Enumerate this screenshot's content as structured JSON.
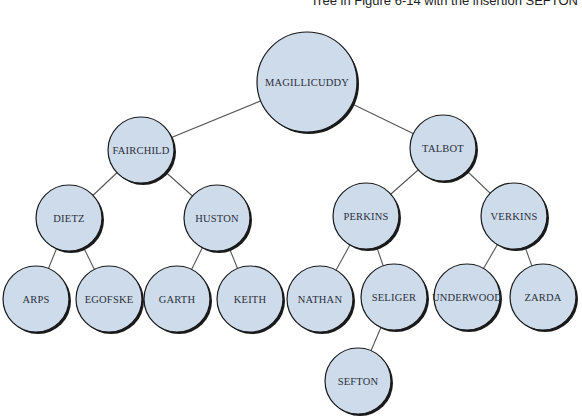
{
  "caption": "Tree in Figure 6-14 with the insertion SEFTON",
  "colors": {
    "node_fill": "#cddbeb",
    "node_stroke": "#1a1a1a",
    "edge": "#555555",
    "label": "#2b2f3a"
  },
  "nodes": [
    {
      "id": "magillicuddy",
      "label": "MAGILLICUDDY",
      "cx": 307,
      "cy": 82,
      "r": 50
    },
    {
      "id": "fairchild",
      "label": "FAIRCHILD",
      "cx": 141,
      "cy": 150,
      "r": 33
    },
    {
      "id": "talbot",
      "label": "TALBOT",
      "cx": 443,
      "cy": 148,
      "r": 33
    },
    {
      "id": "dietz",
      "label": "DIETZ",
      "cx": 69,
      "cy": 218,
      "r": 33
    },
    {
      "id": "huston",
      "label": "HUSTON",
      "cx": 217,
      "cy": 218,
      "r": 33
    },
    {
      "id": "perkins",
      "label": "PERKINS",
      "cx": 366,
      "cy": 216,
      "r": 33
    },
    {
      "id": "verkins",
      "label": "VERKINS",
      "cx": 514,
      "cy": 216,
      "r": 33
    },
    {
      "id": "arps",
      "label": "ARPS",
      "cx": 36,
      "cy": 299,
      "r": 33
    },
    {
      "id": "egofske",
      "label": "EGOFSKE",
      "cx": 109,
      "cy": 299,
      "r": 33
    },
    {
      "id": "garth",
      "label": "GARTH",
      "cx": 177,
      "cy": 299,
      "r": 33
    },
    {
      "id": "keith",
      "label": "KEITH",
      "cx": 250,
      "cy": 299,
      "r": 33
    },
    {
      "id": "nathan",
      "label": "NATHAN",
      "cx": 320,
      "cy": 299,
      "r": 33
    },
    {
      "id": "seliger",
      "label": "SELIGER",
      "cx": 394,
      "cy": 297,
      "r": 33
    },
    {
      "id": "underwood",
      "label": "UNDERWOOD",
      "cx": 467,
      "cy": 297,
      "r": 33
    },
    {
      "id": "zarda",
      "label": "ZARDA",
      "cx": 543,
      "cy": 297,
      "r": 33
    },
    {
      "id": "sefton",
      "label": "SEFTON",
      "cx": 358,
      "cy": 381,
      "r": 33
    }
  ],
  "edges": [
    [
      "magillicuddy",
      "fairchild"
    ],
    [
      "magillicuddy",
      "talbot"
    ],
    [
      "fairchild",
      "dietz"
    ],
    [
      "fairchild",
      "huston"
    ],
    [
      "talbot",
      "perkins"
    ],
    [
      "talbot",
      "verkins"
    ],
    [
      "dietz",
      "arps"
    ],
    [
      "dietz",
      "egofske"
    ],
    [
      "huston",
      "garth"
    ],
    [
      "huston",
      "keith"
    ],
    [
      "perkins",
      "nathan"
    ],
    [
      "perkins",
      "seliger"
    ],
    [
      "verkins",
      "underwood"
    ],
    [
      "verkins",
      "zarda"
    ],
    [
      "seliger",
      "sefton"
    ]
  ]
}
